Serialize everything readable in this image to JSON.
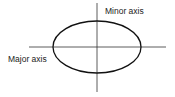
{
  "diagram": {
    "labels": {
      "minor_axis": "Minor axis",
      "major_axis": "Major axis"
    },
    "shape": {
      "type": "ellipse",
      "cx": 97,
      "cy": 47,
      "rx": 44,
      "ry": 26
    },
    "axes": {
      "horizontal": {
        "x1": 29,
        "x2": 166,
        "y": 47
      },
      "vertical": {
        "x": 97,
        "y1": 3,
        "y2": 92
      }
    },
    "stroke_color": "#222222"
  }
}
